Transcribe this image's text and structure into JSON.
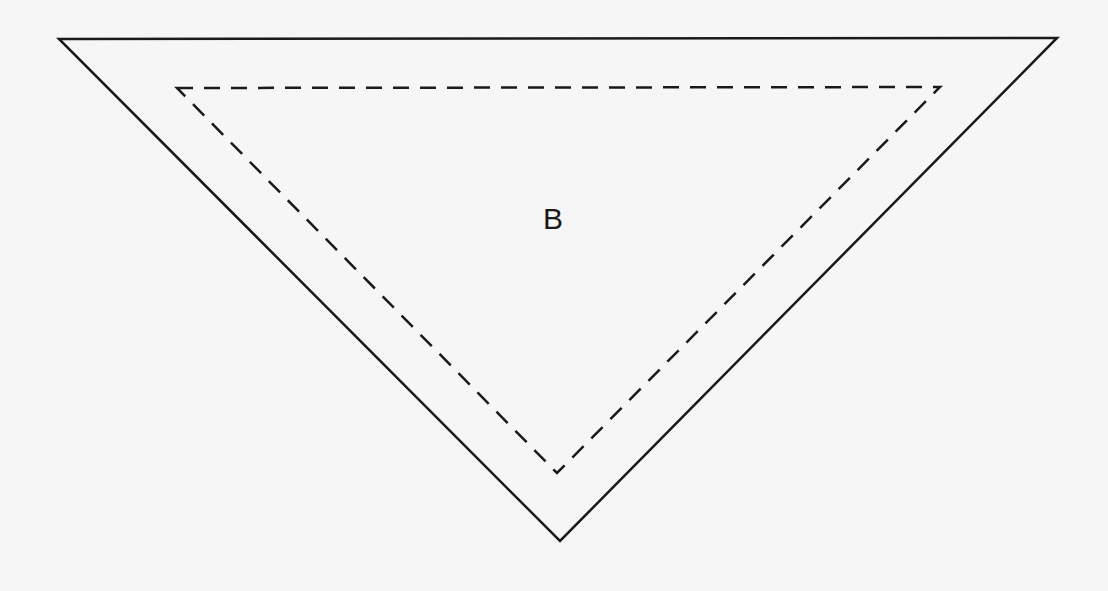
{
  "diagram": {
    "region_label": "B",
    "outer_triangle": {
      "style": "solid",
      "points": [
        [
          59,
          39
        ],
        [
          1057,
          38
        ],
        [
          560,
          541
        ]
      ],
      "stroke": "#1a1a1a"
    },
    "inner_triangle": {
      "style": "dashed",
      "points": [
        [
          177,
          88
        ],
        [
          940,
          87
        ],
        [
          557,
          473
        ]
      ],
      "stroke": "#1a1a1a",
      "dash": "16 11"
    }
  }
}
